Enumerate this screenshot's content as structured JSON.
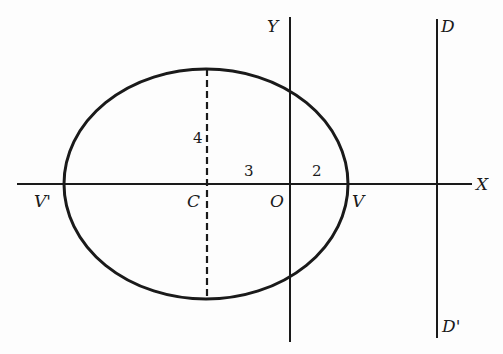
{
  "diagram": {
    "stroke_color": "#1a1a1a",
    "background": "#fdfdfd",
    "labels": {
      "x_axis": "X",
      "y_axis": "Y",
      "origin": "O",
      "center": "C",
      "vertex_right": "V",
      "vertex_left": "V'",
      "directrix_top": "D",
      "directrix_bottom": "D'"
    },
    "dimensions": {
      "semi_minor": "4",
      "center_to_origin": "3",
      "origin_to_vertex": "2"
    },
    "geometry": {
      "ellipse": {
        "cx": 206,
        "cy": 184,
        "rx": 142,
        "ry": 115
      },
      "x_axis": {
        "x1": 17,
        "x2": 472,
        "y": 184
      },
      "y_axis": {
        "x": 290,
        "y1": 17,
        "y2": 342
      },
      "directrix": {
        "x": 437,
        "y1": 19,
        "y2": 338
      },
      "minor_axis_dashed": {
        "x": 207,
        "y1": 69,
        "y2": 299
      }
    }
  }
}
